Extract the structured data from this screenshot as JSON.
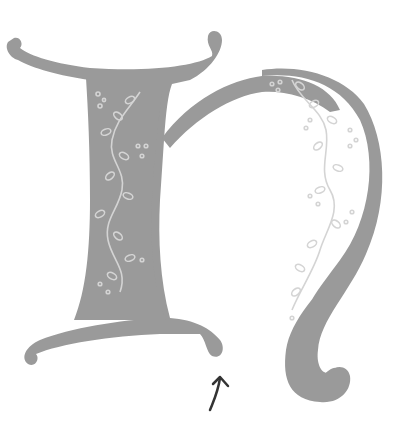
{
  "illustration": {
    "subject": "Decorative illuminated letter h with vine pattern",
    "letter": "h",
    "colors": {
      "background": "#ffffff",
      "letter_fill": "#9a9a9a",
      "vine": "#d4d4d4",
      "arrow": "#333333"
    },
    "annotation": "arrow pointing up"
  }
}
